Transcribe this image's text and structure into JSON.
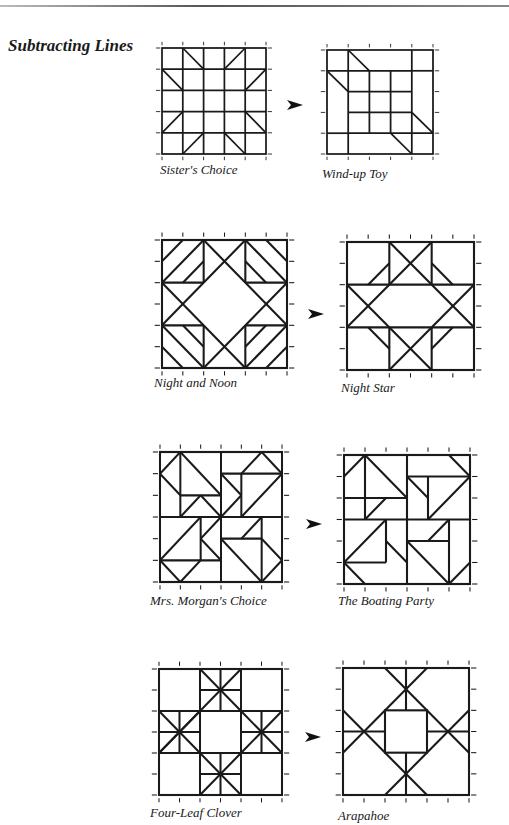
{
  "page": {
    "section_title": "Subtracting Lines"
  },
  "pairs": [
    {
      "from": {
        "name": "Sister's Choice"
      },
      "to": {
        "name": "Wind-up Toy"
      }
    },
    {
      "from": {
        "name": "Night and Noon"
      },
      "to": {
        "name": "Night Star"
      }
    },
    {
      "from": {
        "name": "Mrs. Morgan's Choice"
      },
      "to": {
        "name": "The Boating Party"
      }
    },
    {
      "from": {
        "name": "Four-Leaf Clover"
      },
      "to": {
        "name": "Arapahoe"
      }
    }
  ],
  "icons": {
    "arrow": "arrow-right-icon"
  },
  "colors": {
    "line": "#1a1a1a",
    "background": "#ffffff"
  }
}
